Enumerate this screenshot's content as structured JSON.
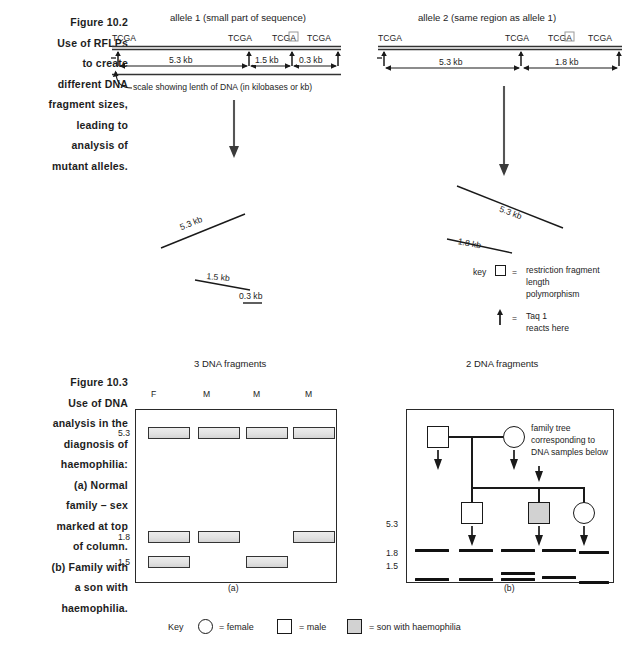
{
  "figure_102": {
    "caption_lines": [
      "Figure 10.2",
      "Use of RFLPs",
      "to create",
      "different DNA",
      "fragment sizes,",
      "leading to",
      "analysis of",
      "mutant alleles."
    ]
  },
  "figure_103": {
    "caption_lines": [
      "Figure 10.3",
      "Use of DNA",
      "analysis in the",
      "diagnosis of",
      "haemophilia:",
      "(a) Normal",
      "family – sex",
      "marked at top",
      "of column.",
      "(b) Family with",
      "a son with",
      "haemophilia."
    ]
  },
  "allele1": {
    "title": "allele 1 (small part of sequence)",
    "sites": [
      "TCGA",
      "TCGA",
      "TCGA",
      "TCGA"
    ],
    "segments": [
      {
        "label": "5.3 kb"
      },
      {
        "label": "1.5 kb"
      },
      {
        "label": "0.3 kb"
      }
    ],
    "scale_note": "scale showing lenth of DNA (in kilobases or kb)",
    "fragments": [
      "5.3 kb",
      "1.5 kb",
      "0.3 kb"
    ],
    "result": "3 DNA fragments"
  },
  "allele2": {
    "title": "allele 2 (same region as allele 1)",
    "sites": [
      "TCGA",
      "TCGA",
      "TCGA",
      "TCGA"
    ],
    "segments": [
      {
        "label": "5.3 kb"
      },
      {
        "label": "1.8 kb"
      }
    ],
    "fragments": [
      "5.3 kb",
      "1.8 kb"
    ],
    "result": "2 DNA fragments"
  },
  "key_rflp": {
    "key_word": "key",
    "equals": "=",
    "lines": [
      "restriction fragment",
      "length",
      "polymorphism"
    ],
    "taq_equals": "=",
    "taq_lines": [
      "Taq 1",
      "reacts here"
    ]
  },
  "gel_a": {
    "panel_label": "(a)",
    "column_headers": [
      "F",
      "M",
      "M",
      "M"
    ],
    "size_labels": [
      "5.3",
      "1.8",
      "1.5"
    ],
    "lanes": [
      {
        "header": "F",
        "bands": [
          "5.3",
          "1.8",
          "1.5"
        ]
      },
      {
        "header": "M",
        "bands": [
          "5.3",
          "1.8"
        ]
      },
      {
        "header": "M",
        "bands": [
          "5.3",
          "1.5"
        ]
      },
      {
        "header": "M",
        "bands": [
          "5.3",
          "1.8"
        ]
      }
    ]
  },
  "gel_b": {
    "panel_label": "(b)",
    "size_labels": [
      "5.3",
      "1.8",
      "1.5"
    ],
    "annotation_lines": [
      "family tree",
      "corresponding to",
      "DNA samples below"
    ],
    "pedigree": {
      "generation1": [
        {
          "symbol": "square",
          "shaded": false
        },
        {
          "symbol": "circle",
          "shaded": false
        }
      ],
      "generation2": [
        {
          "symbol": "square",
          "shaded": false
        },
        {
          "symbol": "square",
          "shaded": true
        },
        {
          "symbol": "circle",
          "shaded": false
        }
      ]
    },
    "lanes": [
      {
        "bands": [
          "5.3",
          "1.5"
        ]
      },
      {
        "bands": [
          "5.3",
          "1.5"
        ]
      },
      {
        "bands": [
          "5.3",
          "1.8",
          "1.5"
        ]
      },
      {
        "bands": [
          "5.3",
          "1.5"
        ]
      },
      {
        "bands": [
          "5.3",
          "1.5"
        ]
      }
    ]
  },
  "bottom_key": {
    "key_word": "Key",
    "female": "= female",
    "male": "= male",
    "affected": "= son with haemophilia"
  },
  "colors": {
    "ink": "#1d1d1d",
    "band_fill": "#e4e4e4",
    "shaded_fill": "#d2d2d2"
  }
}
